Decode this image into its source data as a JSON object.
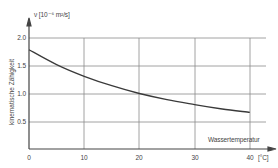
{
  "chart_data": {
    "type": "line",
    "title": "",
    "xlabel": "Wassertemperatur",
    "xunit": "[°C]",
    "ylabel": "kinematische Zähigkeit",
    "yunit_symbol": "ν",
    "yunit": "[10⁻⁶ m²/s]",
    "x_ticks": [
      "0",
      "10",
      "20",
      "30",
      "40"
    ],
    "y_ticks": [
      "0.5",
      "1.0",
      "1.5",
      "2.0"
    ],
    "xlim": [
      0,
      43
    ],
    "ylim": [
      0,
      2.0
    ],
    "grid": true,
    "legend": null,
    "series": [
      {
        "name": "kinematische Zähigkeit von Wasser",
        "x": [
          0,
          5,
          10,
          15,
          20,
          25,
          30,
          35,
          40
        ],
        "values": [
          1.79,
          1.52,
          1.31,
          1.14,
          1.0,
          0.89,
          0.8,
          0.72,
          0.66
        ]
      }
    ]
  },
  "labels": {
    "y_unit": "ν  [10⁻⁶ m²/s]",
    "y_title": "kinematische Zähigkeit",
    "x_title": "Wassertemperatur",
    "x_unit": "[°C]",
    "x_ticks": [
      "0",
      "10",
      "20",
      "30",
      "40"
    ],
    "y_ticks": [
      "0.5",
      "1.0",
      "1.5",
      "2.0"
    ]
  }
}
